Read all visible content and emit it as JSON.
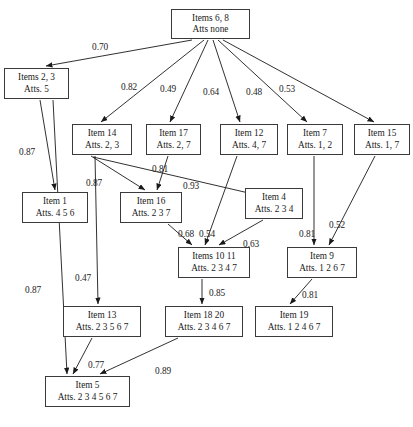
{
  "diagram": {
    "type": "directed-graph",
    "title": "",
    "node_style": {
      "border_color": "#3a3a3a",
      "fill": "#ffffff",
      "text_color": "#1a1a1a"
    },
    "edge_style": {
      "color": "#1a1a1a",
      "arrowhead": "filled-triangle"
    },
    "nodes": [
      {
        "id": "n0",
        "line1": "Items 6, 8",
        "line2": "Atts  none",
        "x": 171,
        "y": 9,
        "w": 79,
        "h": 30
      },
      {
        "id": "n1",
        "line1": "Items 2, 3",
        "line2": "Atts. 5",
        "x": 4,
        "y": 68,
        "w": 65,
        "h": 31
      },
      {
        "id": "n2",
        "line1": "Item 14",
        "line2": "Atts. 2, 3",
        "x": 72,
        "y": 124,
        "w": 60,
        "h": 31
      },
      {
        "id": "n3",
        "line1": "Item 17",
        "line2": "Atts. 2, 7",
        "x": 146,
        "y": 124,
        "w": 55,
        "h": 31
      },
      {
        "id": "n4",
        "line1": "Item 12",
        "line2": "Atts. 4, 7",
        "x": 220,
        "y": 124,
        "w": 58,
        "h": 31
      },
      {
        "id": "n5",
        "line1": "Item 7",
        "line2": "Atts. 1, 2",
        "x": 287,
        "y": 124,
        "w": 56,
        "h": 31
      },
      {
        "id": "n6",
        "line1": "Item 15",
        "line2": "Atts. 1, 7",
        "x": 354,
        "y": 124,
        "w": 56,
        "h": 31
      },
      {
        "id": "n7",
        "line1": "Item 1",
        "line2": "Atts. 4 5 6",
        "x": 22,
        "y": 192,
        "w": 66,
        "h": 31
      },
      {
        "id": "n8",
        "line1": "Item 16",
        "line2": "Atts. 2 3 7",
        "x": 120,
        "y": 192,
        "w": 62,
        "h": 31
      },
      {
        "id": "n9",
        "line1": "Item 4",
        "line2": "Atts. 2 3 4",
        "x": 245,
        "y": 188,
        "w": 58,
        "h": 31
      },
      {
        "id": "n10",
        "line1": "Items 10 11",
        "line2": "Atts. 2 3 4 7",
        "x": 178,
        "y": 247,
        "w": 72,
        "h": 31
      },
      {
        "id": "n11",
        "line1": "Item 9",
        "line2": "Atts. 1 2 6 7",
        "x": 287,
        "y": 247,
        "w": 70,
        "h": 31
      },
      {
        "id": "n12",
        "line1": "Item 13",
        "line2": "Atts. 2 3 5 6 7",
        "x": 63,
        "y": 306,
        "w": 78,
        "h": 31
      },
      {
        "id": "n13",
        "line1": "Item 18 20",
        "line2": "Atts. 2 3 4 6 7",
        "x": 165,
        "y": 306,
        "w": 78,
        "h": 31
      },
      {
        "id": "n14",
        "line1": "Item 19",
        "line2": "Atts. 1 2 4 6 7",
        "x": 255,
        "y": 306,
        "w": 78,
        "h": 31
      },
      {
        "id": "n15",
        "line1": "Item 5",
        "line2": "Atts. 2 3 4 5 6 7",
        "x": 45,
        "y": 376,
        "w": 85,
        "h": 31
      }
    ],
    "edges": [
      {
        "from": "n0",
        "to": "n1",
        "label": "0.70",
        "lx": 92,
        "ly": 42,
        "x1": 192,
        "y1": 40,
        "x2": 46,
        "y2": 66
      },
      {
        "from": "n0",
        "to": "n2",
        "label": "0.82",
        "lx": 121,
        "ly": 82,
        "x1": 204,
        "y1": 40,
        "x2": 101,
        "y2": 122
      },
      {
        "from": "n0",
        "to": "n3",
        "label": "0.49",
        "lx": 160,
        "ly": 84,
        "x1": 208,
        "y1": 40,
        "x2": 170,
        "y2": 122
      },
      {
        "from": "n0",
        "to": "n4",
        "label": "0.64",
        "lx": 203,
        "ly": 87,
        "x1": 213,
        "y1": 40,
        "x2": 240,
        "y2": 122
      },
      {
        "from": "n0",
        "to": "n5",
        "label": "0.48",
        "lx": 246,
        "ly": 87,
        "x1": 218,
        "y1": 40,
        "x2": 307,
        "y2": 122
      },
      {
        "from": "n0",
        "to": "n6",
        "label": "0.53",
        "lx": 279,
        "ly": 84,
        "x1": 223,
        "y1": 40,
        "x2": 374,
        "y2": 122
      },
      {
        "from": "n1",
        "to": "n7",
        "label": "0.87",
        "lx": 19,
        "ly": 147,
        "x1": 40,
        "y1": 100,
        "x2": 55,
        "y2": 190
      },
      {
        "from": "n1",
        "to": "n15",
        "label": "0.87",
        "lx": 25,
        "ly": 285,
        "x1": 53,
        "y1": 100,
        "x2": 67,
        "y2": 374
      },
      {
        "from": "n2",
        "to": "n8",
        "label": "0.87",
        "lx": 86,
        "ly": 178,
        "x1": 91,
        "y1": 156,
        "x2": 145,
        "y2": 190
      },
      {
        "from": "n2",
        "to": "n9",
        "label": "0.93",
        "lx": 183,
        "ly": 181,
        "x1": 93,
        "y1": 157,
        "x2": 279,
        "y2": 200
      },
      {
        "from": "n2",
        "to": "n12",
        "label": "0.47",
        "lx": 75,
        "ly": 273,
        "x1": 95,
        "y1": 156,
        "x2": 98,
        "y2": 304
      },
      {
        "from": "n3",
        "to": "n8",
        "label": "0.81",
        "lx": 152,
        "ly": 164,
        "x1": 168,
        "y1": 156,
        "x2": 157,
        "y2": 190
      },
      {
        "from": "n4",
        "to": "n10",
        "label": "0.54",
        "lx": 199,
        "ly": 229,
        "x1": 237,
        "y1": 156,
        "x2": 205,
        "y2": 245
      },
      {
        "from": "n5",
        "to": "n11",
        "label": "0.81",
        "lx": 299,
        "ly": 229,
        "x1": 314,
        "y1": 156,
        "x2": 314,
        "y2": 245
      },
      {
        "from": "n6",
        "to": "n11",
        "label": "0.52",
        "lx": 329,
        "ly": 220,
        "x1": 375,
        "y1": 156,
        "x2": 329,
        "y2": 245
      },
      {
        "from": "n8",
        "to": "n10",
        "label": "0.68",
        "lx": 178,
        "ly": 229,
        "x1": 168,
        "y1": 224,
        "x2": 192,
        "y2": 245
      },
      {
        "from": "n9",
        "to": "n10",
        "label": "0.63",
        "lx": 243,
        "ly": 239,
        "x1": 263,
        "y1": 220,
        "x2": 219,
        "y2": 245
      },
      {
        "from": "n10",
        "to": "n13",
        "label": "0.85",
        "lx": 209,
        "ly": 288,
        "x1": 202,
        "y1": 279,
        "x2": 202,
        "y2": 304
      },
      {
        "from": "n11",
        "to": "n14",
        "label": "0.81",
        "lx": 302,
        "ly": 290,
        "x1": 312,
        "y1": 279,
        "x2": 290,
        "y2": 304
      },
      {
        "from": "n12",
        "to": "n15",
        "label": "0.77",
        "lx": 88,
        "ly": 360,
        "x1": 92,
        "y1": 338,
        "x2": 73,
        "y2": 374
      },
      {
        "from": "n13",
        "to": "n15",
        "label": "0.89",
        "lx": 155,
        "ly": 366,
        "x1": 178,
        "y1": 338,
        "x2": 100,
        "y2": 374
      }
    ]
  }
}
